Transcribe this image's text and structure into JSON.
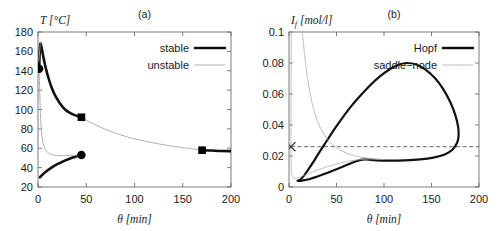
{
  "figure": {
    "panels": [
      "a",
      "b"
    ]
  },
  "chart_data": [
    {
      "type": "line",
      "panel_id": "a",
      "title": "(a)",
      "xlabel": "θ [min]",
      "ylabel": "T [°C]",
      "ylabel_symbol": "T",
      "ylabel_unit": "[°C]",
      "xlabel_symbol": "θ",
      "xlabel_unit": "[min]",
      "xlim": [
        0,
        200
      ],
      "ylim": [
        20,
        180
      ],
      "xticks": [
        0,
        50,
        100,
        150,
        200
      ],
      "yticks": [
        20,
        40,
        60,
        80,
        100,
        120,
        140,
        160,
        180
      ],
      "grid": false,
      "legend_position": "top-right",
      "legend": [
        {
          "label": "stable",
          "style": "thick-solid-black",
          "color": "#111111"
        },
        {
          "label": "unstable",
          "style": "thin-solid-gray",
          "color": "#a8a8a8"
        }
      ],
      "series": [
        {
          "name": "stable upper branch",
          "style": "stable",
          "points": [
            [
              1.2,
              142.0
            ],
            [
              1.6,
              155.0
            ],
            [
              2.0,
              164.0
            ],
            [
              2.4,
              168.0
            ],
            [
              3.2,
              166.0
            ],
            [
              4.5,
              160.0
            ],
            [
              6.0,
              152.0
            ],
            [
              8.0,
              143.0
            ],
            [
              11.0,
              132.0
            ],
            [
              14.0,
              123.0
            ],
            [
              18.0,
              114.0
            ],
            [
              23.0,
              106.0
            ],
            [
              28.0,
              100.0
            ],
            [
              34.0,
              96.0
            ],
            [
              40.0,
              93.5
            ],
            [
              45.0,
              92.0
            ]
          ]
        },
        {
          "name": "stable lower branch",
          "style": "stable",
          "points": [
            [
              2.0,
              30.0
            ],
            [
              5.0,
              33.0
            ],
            [
              9.0,
              36.5
            ],
            [
              14.0,
              40.0
            ],
            [
              20.0,
              43.5
            ],
            [
              26.0,
              46.5
            ],
            [
              32.0,
              49.0
            ],
            [
              38.0,
              51.0
            ],
            [
              42.0,
              52.2
            ],
            [
              45.0,
              53.0
            ]
          ]
        },
        {
          "name": "stable right branch",
          "style": "stable",
          "points": [
            [
              170.0,
              58.0
            ],
            [
              180.0,
              57.6
            ],
            [
              190.0,
              57.2
            ],
            [
              200.0,
              57.0
            ]
          ]
        },
        {
          "name": "unstable upper segment",
          "style": "unstable",
          "points": [
            [
              0.8,
              150.0
            ],
            [
              1.3,
              155.0
            ],
            [
              1.8,
              161.0
            ],
            [
              2.2,
              166.0
            ],
            [
              2.4,
              168.0
            ]
          ]
        },
        {
          "name": "unstable middle branch",
          "style": "unstable",
          "points": [
            [
              1.2,
              142.0
            ],
            [
              1.5,
              130.0
            ],
            [
              1.9,
              116.0
            ],
            [
              2.3,
              102.0
            ],
            [
              2.8,
              90.0
            ],
            [
              3.4,
              80.0
            ],
            [
              4.2,
              72.0
            ],
            [
              5.4,
              65.0
            ],
            [
              7.5,
              59.0
            ],
            [
              11.0,
              55.0
            ],
            [
              16.0,
              53.0
            ],
            [
              22.0,
              52.4
            ],
            [
              30.0,
              52.4
            ],
            [
              38.0,
              52.7
            ],
            [
              45.0,
              53.0
            ]
          ]
        },
        {
          "name": "unstable right branch",
          "style": "unstable",
          "points": [
            [
              45.0,
              92.0
            ],
            [
              52.0,
              88.0
            ],
            [
              60.0,
              84.0
            ],
            [
              70.0,
              79.5
            ],
            [
              82.0,
              75.0
            ],
            [
              95.0,
              71.0
            ],
            [
              110.0,
              67.5
            ],
            [
              125.0,
              64.5
            ],
            [
              140.0,
              62.0
            ],
            [
              155.0,
              60.0
            ],
            [
              170.0,
              58.0
            ]
          ]
        }
      ],
      "markers": [
        {
          "shape": "circle",
          "x": 1.2,
          "y": 142.0,
          "name": "fold-point-upper"
        },
        {
          "shape": "circle",
          "x": 45.0,
          "y": 53.0,
          "name": "fold-point-lower"
        },
        {
          "shape": "square",
          "x": 45.0,
          "y": 92.0,
          "name": "bifurcation-point-upper"
        },
        {
          "shape": "square",
          "x": 170.0,
          "y": 58.0,
          "name": "bifurcation-point-right"
        }
      ]
    },
    {
      "type": "line",
      "panel_id": "b",
      "title": "(b)",
      "xlabel": "θ [min]",
      "ylabel": "I_f [mol/l]",
      "ylabel_symbol": "I",
      "ylabel_subscript": "f",
      "ylabel_unit": "[mol/l]",
      "xlabel_symbol": "θ",
      "xlabel_unit": "[min]",
      "xlim": [
        0,
        200
      ],
      "ylim": [
        0,
        0.1
      ],
      "xticks": [
        0,
        50,
        100,
        150,
        200
      ],
      "yticks": [
        0,
        0.02,
        0.04,
        0.06,
        0.08,
        0.1
      ],
      "ytick_labels": [
        "0",
        "0.02",
        "0.04",
        "0.06",
        "0.08",
        "0.1"
      ],
      "grid": false,
      "legend_position": "top-right",
      "legend": [
        {
          "label": "Hopf",
          "style": "thick-solid-black",
          "color": "#111111"
        },
        {
          "label": "saddle−node",
          "style": "dotted-gray",
          "color": "#a8a8a8"
        }
      ],
      "series": [
        {
          "name": "Hopf curve",
          "style": "hopf",
          "points": [
            [
              9.0,
              0.004
            ],
            [
              12.0,
              0.0048
            ],
            [
              16.0,
              0.0075
            ],
            [
              20.0,
              0.011
            ],
            [
              26.0,
              0.0165
            ],
            [
              32.0,
              0.0225
            ],
            [
              40.0,
              0.03
            ],
            [
              48.0,
              0.0375
            ],
            [
              56.0,
              0.0445
            ],
            [
              66.0,
              0.0525
            ],
            [
              76.0,
              0.0595
            ],
            [
              86.0,
              0.066
            ],
            [
              96.0,
              0.0715
            ],
            [
              106.0,
              0.076
            ],
            [
              116.0,
              0.079
            ],
            [
              124.0,
              0.08
            ],
            [
              134.0,
              0.079
            ],
            [
              144.0,
              0.0755
            ],
            [
              154.0,
              0.07
            ],
            [
              162.0,
              0.0635
            ],
            [
              170.0,
              0.0545
            ],
            [
              175.0,
              0.0465
            ],
            [
              178.0,
              0.039
            ],
            [
              178.5,
              0.033
            ],
            [
              177.0,
              0.0285
            ],
            [
              172.0,
              0.024
            ],
            [
              164.0,
              0.021
            ],
            [
              152.0,
              0.019
            ],
            [
              138.0,
              0.0178
            ],
            [
              122.0,
              0.0172
            ],
            [
              106.0,
              0.017
            ],
            [
              92.0,
              0.0172
            ],
            [
              80.0,
              0.0178
            ],
            [
              70.0,
              0.0165
            ],
            [
              60.0,
              0.014
            ],
            [
              50.0,
              0.0115
            ],
            [
              40.0,
              0.009
            ],
            [
              30.0,
              0.0068
            ],
            [
              22.0,
              0.0052
            ],
            [
              15.0,
              0.0043
            ],
            [
              9.0,
              0.004
            ]
          ]
        },
        {
          "name": "saddle-node upper branch",
          "style": "saddle",
          "points": [
            [
              2.0,
              0.026
            ],
            [
              2.1,
              0.05
            ],
            [
              2.2,
              0.08
            ],
            [
              2.3,
              0.1
            ]
          ]
        },
        {
          "name": "saddle-node descending branch",
          "style": "saddle",
          "points": [
            [
              14.0,
              0.1
            ],
            [
              16.0,
              0.088
            ],
            [
              18.0,
              0.077
            ],
            [
              20.0,
              0.068
            ],
            [
              23.0,
              0.058
            ],
            [
              26.0,
              0.05
            ],
            [
              30.0,
              0.0425
            ],
            [
              34.0,
              0.037
            ],
            [
              39.0,
              0.032
            ],
            [
              45.0,
              0.0278
            ],
            [
              52.0,
              0.0245
            ],
            [
              60.0,
              0.022
            ],
            [
              68.0,
              0.0203
            ],
            [
              76.0,
              0.0192
            ],
            [
              84.0,
              0.0185
            ],
            [
              92.0,
              0.018
            ],
            [
              100.0,
              0.0177
            ]
          ]
        },
        {
          "name": "saddle-node lower branch",
          "style": "saddle",
          "points": [
            [
              2.0,
              0.026
            ],
            [
              2.2,
              0.015
            ],
            [
              2.6,
              0.0095
            ],
            [
              3.5,
              0.0068
            ],
            [
              5.0,
              0.0058
            ],
            [
              8.0,
              0.0058
            ],
            [
              12.0,
              0.0065
            ],
            [
              18.0,
              0.008
            ],
            [
              26.0,
              0.01
            ],
            [
              36.0,
              0.0122
            ],
            [
              48.0,
              0.0145
            ],
            [
              60.0,
              0.0163
            ],
            [
              72.0,
              0.0175
            ],
            [
              84.0,
              0.018
            ],
            [
              96.0,
              0.018
            ]
          ]
        }
      ],
      "reference_line": {
        "name": "operating-level",
        "orientation": "horizontal",
        "y": 0.026,
        "x_start": 2.0,
        "x_end": 200.0,
        "style": "dashed"
      },
      "markers": [
        {
          "shape": "cross",
          "x": 2.0,
          "y": 0.026,
          "name": "operating-point"
        }
      ]
    }
  ]
}
